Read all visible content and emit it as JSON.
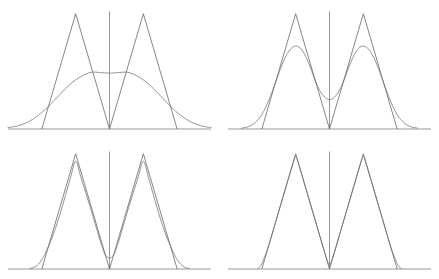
{
  "figure": {
    "title": "",
    "background_color": "#ffffff",
    "rows": 2,
    "cols": 2,
    "panel_count": 4
  },
  "style": {
    "axis_color": "#6a6a6a",
    "true_density_color": "#5e5e5e",
    "kde_color": "#707070",
    "line_width": 0.75
  },
  "chart_data": {
    "type": "line",
    "title": "",
    "xlabel": "",
    "ylabel": "",
    "grid": false,
    "legend": "none",
    "xlim": [
      -3,
      3
    ],
    "ylim": [
      0,
      1.05
    ],
    "panels": [
      {
        "index": 0,
        "position": "top-left",
        "x_axis_from": -3.0,
        "x_axis_to": 3.0,
        "y_axis_at_x": 0.0,
        "y_axis_top": 1.02,
        "series": [
          {
            "name": "true-density",
            "kind": "triangular-bimodal",
            "points_x": [
              -2.0,
              -1.0,
              0.0,
              1.0,
              2.0
            ],
            "points_y": [
              0.0,
              1.0,
              0.0,
              1.0,
              0.0
            ]
          },
          {
            "name": "kde-estimate",
            "kind": "smooth",
            "bandwidth": 0.8,
            "peak_value": 0.5,
            "peak_x": [
              -0.55,
              0.55
            ],
            "center_value": 0.485,
            "shape": "oversmoothed-plateau",
            "x": [
              -3.0,
              -2.7,
              -2.4,
              -2.1,
              -1.9,
              -1.7,
              -1.5,
              -1.3,
              -1.1,
              -0.9,
              -0.7,
              -0.5,
              -0.3,
              -0.1,
              0.0,
              0.1,
              0.3,
              0.5,
              0.7,
              0.9,
              1.1,
              1.3,
              1.5,
              1.7,
              1.9,
              2.1,
              2.4,
              2.7,
              3.0
            ],
            "y": [
              0.012,
              0.028,
              0.062,
              0.12,
              0.17,
              0.228,
              0.29,
              0.35,
              0.404,
              0.446,
              0.477,
              0.494,
              0.49,
              0.486,
              0.485,
              0.486,
              0.49,
              0.494,
              0.477,
              0.446,
              0.404,
              0.35,
              0.29,
              0.228,
              0.17,
              0.12,
              0.062,
              0.028,
              0.012
            ]
          }
        ]
      },
      {
        "index": 1,
        "position": "top-right",
        "x_axis_from": -3.0,
        "x_axis_to": 3.0,
        "y_axis_at_x": 0.0,
        "y_axis_top": 1.02,
        "series": [
          {
            "name": "true-density",
            "kind": "triangular-bimodal",
            "points_x": [
              -2.0,
              -1.0,
              0.0,
              1.0,
              2.0
            ],
            "points_y": [
              0.0,
              1.0,
              0.0,
              1.0,
              0.0
            ]
          },
          {
            "name": "kde-estimate",
            "kind": "smooth",
            "bandwidth": 0.4,
            "peak_value": 0.72,
            "peak_x": [
              -1.02,
              1.02
            ],
            "center_value": 0.255,
            "shape": "bimodal-undersmoothed",
            "x": [
              -2.6,
              -2.4,
              -2.2,
              -2.0,
              -1.8,
              -1.6,
              -1.4,
              -1.2,
              -1.0,
              -0.8,
              -0.6,
              -0.45,
              -0.3,
              -0.15,
              0.0,
              0.15,
              0.3,
              0.45,
              0.6,
              0.8,
              1.0,
              1.2,
              1.4,
              1.6,
              1.8,
              2.0,
              2.2,
              2.4,
              2.6
            ],
            "y": [
              0.008,
              0.02,
              0.055,
              0.125,
              0.245,
              0.4,
              0.56,
              0.676,
              0.72,
              0.68,
              0.56,
              0.44,
              0.34,
              0.278,
              0.255,
              0.278,
              0.34,
              0.44,
              0.56,
              0.68,
              0.72,
              0.676,
              0.56,
              0.4,
              0.245,
              0.125,
              0.055,
              0.02,
              0.008
            ]
          }
        ]
      },
      {
        "index": 2,
        "position": "bottom-left",
        "x_axis_from": -3.0,
        "x_axis_to": 3.0,
        "y_axis_at_x": 0.0,
        "y_axis_top": 1.02,
        "series": [
          {
            "name": "true-density",
            "kind": "triangular-bimodal",
            "points_x": [
              -2.0,
              -1.0,
              0.0,
              1.0,
              2.0
            ],
            "points_y": [
              0.0,
              1.0,
              0.0,
              1.0,
              0.0
            ]
          },
          {
            "name": "kde-estimate",
            "kind": "smooth",
            "bandwidth": 0.16,
            "peak_value": 0.935,
            "peak_x": [
              -1.0,
              1.0
            ],
            "center_value": 0.095,
            "shape": "near-true-rounded-corners",
            "x": [
              -2.35,
              -2.2,
              -2.1,
              -2.0,
              -1.9,
              -1.7,
              -1.5,
              -1.3,
              -1.15,
              -1.0,
              -0.85,
              -0.7,
              -0.5,
              -0.3,
              -0.2,
              -0.12,
              0.0,
              0.12,
              0.2,
              0.3,
              0.5,
              0.7,
              0.85,
              1.0,
              1.15,
              1.3,
              1.5,
              1.7,
              1.9,
              2.0,
              2.1,
              2.2,
              2.35
            ],
            "y": [
              0.004,
              0.018,
              0.042,
              0.082,
              0.135,
              0.27,
              0.44,
              0.64,
              0.795,
              0.935,
              0.8,
              0.66,
              0.47,
              0.268,
              0.178,
              0.12,
              0.095,
              0.12,
              0.178,
              0.268,
              0.47,
              0.66,
              0.8,
              0.935,
              0.795,
              0.64,
              0.44,
              0.27,
              0.135,
              0.082,
              0.042,
              0.018,
              0.004
            ]
          }
        ]
      },
      {
        "index": 3,
        "position": "bottom-right",
        "x_axis_from": -3.0,
        "x_axis_to": 3.0,
        "y_axis_at_x": 0.0,
        "y_axis_top": 1.02,
        "series": [
          {
            "name": "true-density",
            "kind": "triangular-bimodal",
            "points_x": [
              -2.0,
              -1.0,
              0.0,
              1.0,
              2.0
            ],
            "points_y": [
              0.0,
              1.0,
              0.0,
              1.0,
              0.0
            ]
          },
          {
            "name": "kde-estimate",
            "kind": "smooth",
            "bandwidth": 0.06,
            "peak_value": 0.975,
            "peak_x": [
              -1.0,
              1.0
            ],
            "center_value": 0.035,
            "shape": "almost-exact-overlay",
            "x": [
              -2.12,
              -2.06,
              -2.0,
              -1.94,
              -1.8,
              -1.6,
              -1.4,
              -1.2,
              -1.08,
              -1.0,
              -0.92,
              -0.8,
              -0.6,
              -0.4,
              -0.2,
              -0.08,
              0.0,
              0.08,
              0.2,
              0.4,
              0.6,
              0.8,
              0.92,
              1.0,
              1.08,
              1.2,
              1.4,
              1.6,
              1.8,
              1.94,
              2.0,
              2.06,
              2.12
            ],
            "y": [
              0.004,
              0.018,
              0.048,
              0.09,
              0.2,
              0.4,
              0.6,
              0.8,
              0.915,
              0.975,
              0.918,
              0.8,
              0.6,
              0.4,
              0.2,
              0.086,
              0.035,
              0.086,
              0.2,
              0.4,
              0.6,
              0.8,
              0.918,
              0.975,
              0.915,
              0.8,
              0.6,
              0.4,
              0.2,
              0.09,
              0.048,
              0.018,
              0.004
            ]
          }
        ]
      }
    ]
  }
}
